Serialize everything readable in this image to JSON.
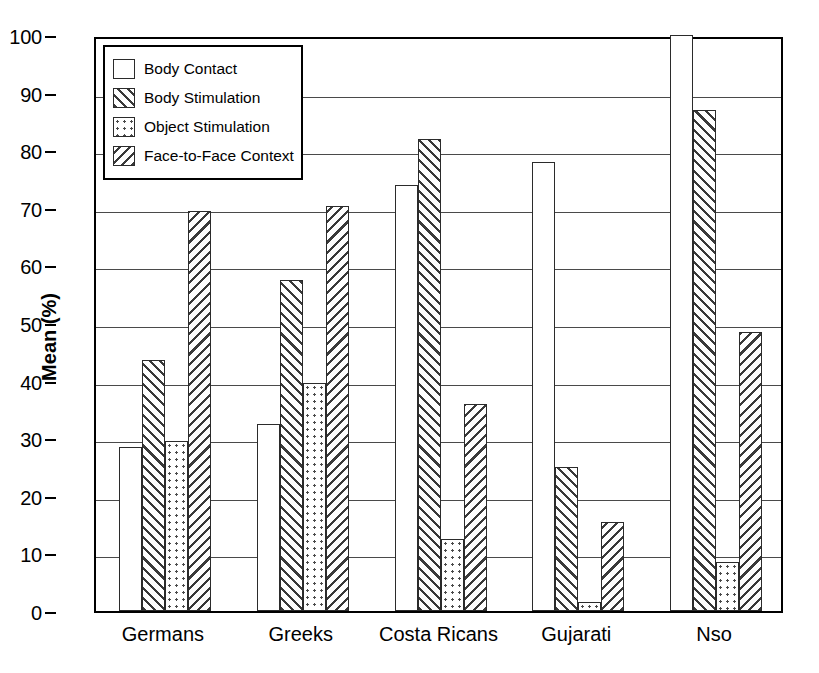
{
  "chart_data": {
    "type": "bar",
    "title": "",
    "xlabel": "",
    "ylabel": "Mean (%)",
    "ylim": [
      0,
      100
    ],
    "ytick_step": 10,
    "grid": true,
    "legend_position": "top-left",
    "categories": [
      "Germans",
      "Greeks",
      "Costa Ricans",
      "Gujarati",
      "Nso"
    ],
    "series": [
      {
        "name": "Body Contact",
        "pattern": "none",
        "values": [
          28.5,
          32.5,
          74.0,
          78.0,
          100.0
        ]
      },
      {
        "name": "Body Stimulation",
        "pattern": "fdiag",
        "values": [
          43.5,
          57.5,
          82.0,
          25.0,
          87.0
        ]
      },
      {
        "name": "Object Stimulation",
        "pattern": "dots",
        "values": [
          29.5,
          39.5,
          12.5,
          1.5,
          8.5
        ]
      },
      {
        "name": "Face-to-Face Context",
        "pattern": "bdiag",
        "values": [
          69.5,
          70.3,
          36.0,
          15.5,
          48.5
        ]
      }
    ],
    "yticks": [
      0,
      10,
      20,
      30,
      40,
      50,
      60,
      70,
      80,
      90,
      100
    ],
    "ytick_labels": [
      "0",
      "10",
      "20",
      "30",
      "40",
      "50",
      "60",
      "70",
      "80",
      "90",
      "100"
    ]
  },
  "legend": {
    "items": [
      {
        "label": "Body Contact"
      },
      {
        "label": "Body Stimulation"
      },
      {
        "label": "Object Stimulation"
      },
      {
        "label": "Face-to-Face Context"
      }
    ]
  },
  "colors": {
    "axis": "#000000",
    "grid": "#4a4a4a",
    "bar_edge": "#2b2b2b",
    "background": "#ffffff"
  }
}
